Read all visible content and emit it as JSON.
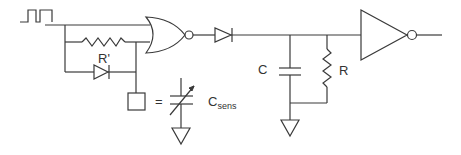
{
  "diagram": {
    "type": "circuit-schematic",
    "components": [
      {
        "id": "square-wave-source",
        "kind": "pulse-input"
      },
      {
        "id": "feedback-resistor",
        "kind": "resistor",
        "label": "R'"
      },
      {
        "id": "feedback-diode",
        "kind": "diode"
      },
      {
        "id": "sensor-terminal",
        "kind": "terminal-box"
      },
      {
        "id": "nor-gate",
        "kind": "NOR gate"
      },
      {
        "id": "series-diode",
        "kind": "diode"
      },
      {
        "id": "capacitor",
        "kind": "capacitor",
        "label": "C"
      },
      {
        "id": "resistor",
        "kind": "resistor",
        "label": "R"
      },
      {
        "id": "inverter",
        "kind": "inverter"
      },
      {
        "id": "variable-capacitor",
        "kind": "variable capacitor",
        "label": "C",
        "label_subscript": "sens"
      }
    ],
    "labels": {
      "r_prime": "R'",
      "c": "C",
      "r": "R",
      "equals": "=",
      "csens_main": "C",
      "csens_sub": "sens"
    },
    "colors": {
      "line": "#3a3a3a",
      "background": "#ffffff"
    }
  }
}
